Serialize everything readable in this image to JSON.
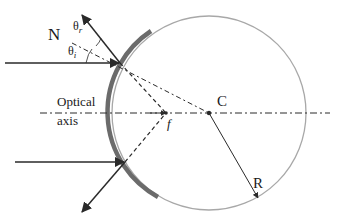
{
  "diagram": {
    "type": "concave-mirror-ray-diagram",
    "labels": {
      "normal": "N",
      "theta_r": "θ",
      "theta_r_sub": "r",
      "theta_i": "θ",
      "theta_i_sub": "i",
      "optical_axis_line1": "Optical",
      "optical_axis_line2": "axis",
      "center": "C",
      "focal": "f",
      "radius": "R"
    },
    "colors": {
      "mirror": "#6b6b6b",
      "circle": "#a8a8a8",
      "rays": "#2a2a2a",
      "text": "#1a1a1a"
    }
  }
}
